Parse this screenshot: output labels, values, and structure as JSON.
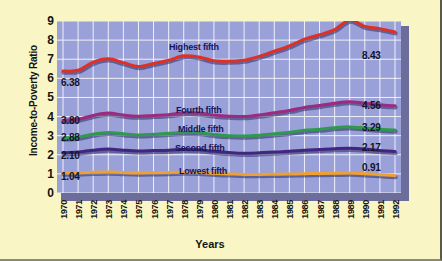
{
  "chart_data": {
    "type": "line",
    "title": "",
    "xlabel": "Years",
    "ylabel": "Income-to-Poverty Ratio",
    "ylim": [
      0,
      9
    ],
    "yticks": [
      "9",
      "8",
      "7",
      "6",
      "5",
      "4",
      "3",
      "2",
      "1",
      "0"
    ],
    "grid": true,
    "legend_position": "inline-labels",
    "x": [
      "1970",
      "1971",
      "1972",
      "1973",
      "1974",
      "1975",
      "1976",
      "1977",
      "1978",
      "1979",
      "1980",
      "1981",
      "1982",
      "1983",
      "1984",
      "1985",
      "1986",
      "1987",
      "1988",
      "1989",
      "1990",
      "1991",
      "1992"
    ],
    "series": [
      {
        "name": "Highest fifth",
        "color": "#e03024",
        "start_label": "6.38",
        "end_label": "8.43",
        "values": [
          6.38,
          6.42,
          6.85,
          7.02,
          6.82,
          6.62,
          6.78,
          6.95,
          7.18,
          7.12,
          6.92,
          6.9,
          6.95,
          7.15,
          7.42,
          7.7,
          8.05,
          8.28,
          8.55,
          9.05,
          8.72,
          8.6,
          8.43
        ]
      },
      {
        "name": "Fourth fifth",
        "color": "#9c2a7e",
        "start_label": "3.80",
        "end_label": "4.56",
        "values": [
          3.8,
          3.86,
          4.06,
          4.18,
          4.08,
          4.02,
          4.06,
          4.1,
          4.2,
          4.18,
          4.08,
          4.02,
          4.0,
          4.08,
          4.2,
          4.32,
          4.48,
          4.58,
          4.7,
          4.78,
          4.7,
          4.62,
          4.56
        ]
      },
      {
        "name": "Middle fifth",
        "color": "#2f9a4e",
        "start_label": "2.88",
        "end_label": "3.29",
        "values": [
          2.88,
          2.93,
          3.08,
          3.17,
          3.1,
          3.04,
          3.08,
          3.12,
          3.18,
          3.16,
          3.06,
          3.0,
          2.98,
          3.02,
          3.1,
          3.18,
          3.28,
          3.34,
          3.42,
          3.46,
          3.4,
          3.33,
          3.29
        ]
      },
      {
        "name": "Second fifth",
        "color": "#41257f",
        "start_label": "2.10",
        "end_label": "2.17",
        "values": [
          2.1,
          2.14,
          2.24,
          2.3,
          2.24,
          2.2,
          2.22,
          2.24,
          2.28,
          2.26,
          2.18,
          2.12,
          2.08,
          2.1,
          2.14,
          2.18,
          2.24,
          2.28,
          2.32,
          2.34,
          2.3,
          2.22,
          2.17
        ]
      },
      {
        "name": "Lowest fifth",
        "color": "#f0a030",
        "start_label": "1.04",
        "end_label": "0.91",
        "values": [
          1.04,
          1.05,
          1.08,
          1.1,
          1.07,
          1.05,
          1.06,
          1.07,
          1.09,
          1.08,
          1.03,
          1.0,
          0.97,
          0.97,
          0.98,
          0.99,
          1.01,
          1.02,
          1.03,
          1.04,
          1.01,
          0.96,
          0.91
        ]
      }
    ]
  },
  "colors": {
    "page_background": "#FAF5C4",
    "plot_background": "#9aa0d8",
    "gridline": "#ffffff",
    "plot_shadow": "#3c3f8c",
    "label_text": "#14145a"
  },
  "series_label_positions": [
    {
      "name": "Highest fifth",
      "left": 112,
      "top": 21
    },
    {
      "name": "Fourth fifth",
      "left": 119,
      "top": 84
    },
    {
      "name": "Middle fifth",
      "left": 121,
      "top": 103
    },
    {
      "name": "Second fifth",
      "left": 118,
      "top": 122
    },
    {
      "name": "Lowest fifth",
      "left": 122,
      "top": 145
    }
  ],
  "value_label_positions": {
    "start": [
      {
        "text": "6.38",
        "left": 4,
        "top": 56
      },
      {
        "text": "3.80",
        "left": 4,
        "top": 94
      },
      {
        "text": "2.88",
        "left": 4,
        "top": 111
      },
      {
        "text": "2.10",
        "left": 4,
        "top": 129
      },
      {
        "text": "1.04",
        "left": 4,
        "top": 150
      }
    ],
    "end": [
      {
        "text": "8.43",
        "left": 305,
        "top": 29
      },
      {
        "text": "4.56",
        "left": 305,
        "top": 79
      },
      {
        "text": "3.29",
        "left": 305,
        "top": 101
      },
      {
        "text": "2.17",
        "left": 305,
        "top": 121
      },
      {
        "text": "0.91",
        "left": 305,
        "top": 141
      }
    ]
  }
}
